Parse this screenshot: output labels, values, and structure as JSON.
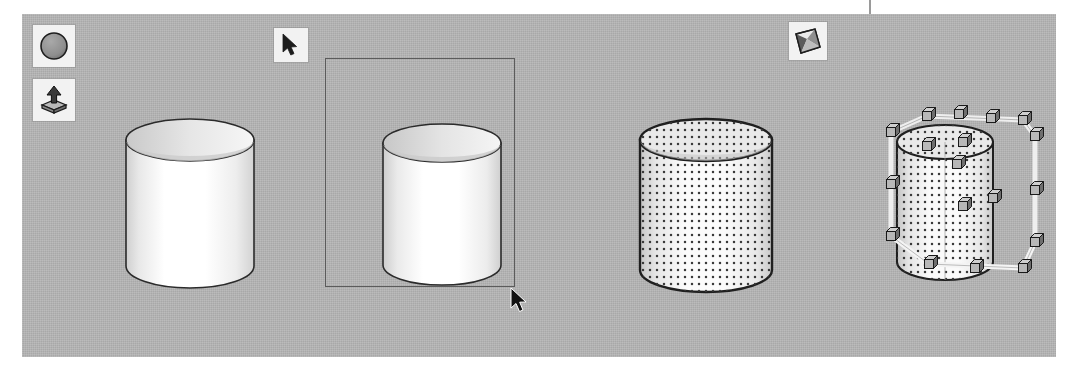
{
  "app": {
    "window_title": "3D Modeling Viewport",
    "viewport_background_color": "#b4b4b4",
    "page_background_color": "#ffffff"
  },
  "toolbar": {
    "orientation": "floating",
    "buttons": [
      {
        "id": "primitive",
        "name": "primitive-sphere-tool",
        "label": "Primitive",
        "icon": "filled-circle-icon",
        "state": "normal"
      },
      {
        "id": "extrude",
        "name": "extrude-tool",
        "label": "Extrude",
        "icon": "extrude-arrow-icon",
        "state": "normal"
      },
      {
        "id": "select",
        "name": "select-tool",
        "label": "Select",
        "icon": "arrow-pointer-icon",
        "state": "active"
      },
      {
        "id": "deform",
        "name": "deform-tool",
        "label": "Deform",
        "icon": "deform-page-icon",
        "state": "normal"
      }
    ]
  },
  "viewport": {
    "cursor": {
      "name": "mouse-pointer",
      "x": 509,
      "y": 287,
      "glyph": "arrow"
    },
    "marquee": {
      "label": "Rubber-band selection",
      "x": 325,
      "y": 58,
      "width": 190,
      "height": 229,
      "stroke_color": "#5b5b5b",
      "visible": true
    },
    "objects": [
      {
        "id": "cyl-1",
        "name": "cylinder-unselected",
        "label": "Cylinder",
        "state": "unselected",
        "fill": "#ffffff",
        "surface_pattern": "smooth-shaded",
        "handles": false
      },
      {
        "id": "cyl-2",
        "name": "cylinder-marquee-selected",
        "label": "Cylinder",
        "state": "marquee-selected",
        "fill": "#ffffff",
        "surface_pattern": "smooth-shaded",
        "handles": false
      },
      {
        "id": "cyl-3",
        "name": "cylinder-highlighted",
        "label": "Cylinder",
        "state": "highlighted",
        "fill": "#f0f0f0",
        "surface_pattern": "stippled-dots",
        "handles": false
      },
      {
        "id": "cyl-4",
        "name": "cylinder-with-manipulators",
        "label": "Cylinder",
        "state": "selected-with-bounding-box",
        "fill": "#f0f0f0",
        "surface_pattern": "stippled-dots",
        "handles": true,
        "handle_count": 18,
        "handle_shape": "cube",
        "bounding_box_color": "#f5f5f5"
      }
    ]
  },
  "colors": {
    "panel_gray": "#b4b4b4",
    "outline_dark": "#2b2b2b",
    "handle_face_light": "#cfcfcf",
    "handle_face_dark": "#6e6e6e",
    "marquee_stroke": "#5b5b5b"
  }
}
